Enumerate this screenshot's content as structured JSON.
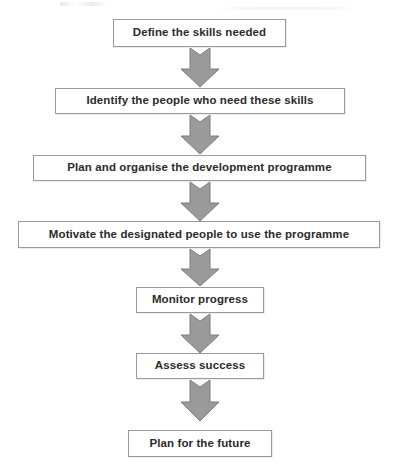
{
  "diagram": {
    "type": "vertical-flowchart",
    "background_color": "#ffffff",
    "box_fill_color": "#ffffff",
    "box_border_color": "#9b9b9b",
    "text_color": "#2b2b2b",
    "arrow_fill_color": "#9a9a9a",
    "arrow_border_color": "#7d7d7d",
    "steps": [
      {
        "id": "step-1",
        "label": "Define the skills needed"
      },
      {
        "id": "step-2",
        "label": "Identify the people who need these skills"
      },
      {
        "id": "step-3",
        "label": "Plan and organise the development programme"
      },
      {
        "id": "step-4",
        "label": "Motivate the designated people to use the programme"
      },
      {
        "id": "step-5",
        "label": "Monitor progress"
      },
      {
        "id": "step-6",
        "label": "Assess success"
      },
      {
        "id": "step-7",
        "label": "Plan for the future"
      }
    ],
    "connectors": [
      {
        "id": "arrow-1",
        "from": "step-1",
        "to": "step-2"
      },
      {
        "id": "arrow-2",
        "from": "step-2",
        "to": "step-3"
      },
      {
        "id": "arrow-3",
        "from": "step-3",
        "to": "step-4"
      },
      {
        "id": "arrow-4",
        "from": "step-4",
        "to": "step-5"
      },
      {
        "id": "arrow-5",
        "from": "step-5",
        "to": "step-6"
      },
      {
        "id": "arrow-6",
        "from": "step-6",
        "to": "step-7"
      }
    ]
  }
}
